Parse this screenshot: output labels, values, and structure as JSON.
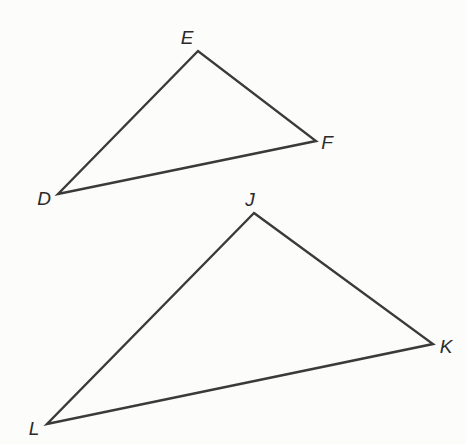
{
  "diagram": {
    "type": "geometry-figure",
    "colors": {
      "background": "#fcfcfb",
      "stroke": "#3a3a3a",
      "label": "#2a2a2a"
    },
    "triangles": [
      {
        "name": "DEF",
        "vertices": [
          {
            "label": "D",
            "x": 58,
            "y": 194,
            "label_x": 44,
            "label_y": 198
          },
          {
            "label": "E",
            "x": 198,
            "y": 51,
            "label_x": 187,
            "label_y": 37
          },
          {
            "label": "F",
            "x": 316,
            "y": 141,
            "label_x": 327,
            "label_y": 142
          }
        ]
      },
      {
        "name": "JKL",
        "vertices": [
          {
            "label": "J",
            "x": 254,
            "y": 213,
            "label_x": 250,
            "label_y": 199
          },
          {
            "label": "K",
            "x": 433,
            "y": 344,
            "label_x": 446,
            "label_y": 346
          },
          {
            "label": "L",
            "x": 47,
            "y": 424,
            "label_x": 34,
            "label_y": 428
          }
        ]
      }
    ]
  }
}
